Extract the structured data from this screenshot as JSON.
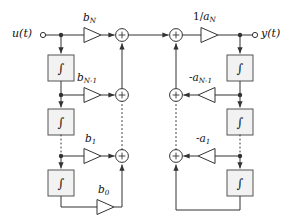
{
  "diagram": {
    "type": "signal-flow-block-diagram",
    "colors": {
      "line": "#333333",
      "block_fill": "#f2f2f2",
      "block_stroke": "#555555",
      "background": "#ffffff",
      "text": "#111111"
    },
    "terminals": {
      "input": {
        "label": "u(t)",
        "base": "u",
        "arg": "(t)"
      },
      "output": {
        "label": "y(t)",
        "base": "y",
        "arg": "(t)"
      }
    },
    "gains": {
      "feedforward": [
        {
          "id": "bN",
          "base": "b",
          "sub": "N",
          "label": "b_N",
          "row": 1,
          "direction": "right"
        },
        {
          "id": "bNm1",
          "base": "b",
          "sub": "N-1",
          "label": "b_N-1",
          "row": 2,
          "direction": "right"
        },
        {
          "id": "b1",
          "base": "b",
          "sub": "1",
          "label": "b_1",
          "row": 3,
          "direction": "right"
        },
        {
          "id": "b0",
          "base": "b",
          "sub": "0",
          "label": "b_0",
          "row": 4,
          "direction": "right"
        }
      ],
      "feedback": [
        {
          "id": "aNm1",
          "prefix": "-",
          "base": "a",
          "sub": "N-1",
          "label": "-a_N-1",
          "row": 2,
          "direction": "left"
        },
        {
          "id": "a1",
          "prefix": "-",
          "base": "a",
          "sub": "1",
          "label": "-a_1",
          "row": 3,
          "direction": "left"
        }
      ],
      "output_gain": {
        "id": "invaN",
        "prefix": "1/",
        "base": "a",
        "sub": "N",
        "label": "1/a_N",
        "row": 1,
        "direction": "right"
      }
    },
    "blocks": {
      "integrator_symbol": "∫",
      "integrator_name": "integrator",
      "left_count": 3,
      "right_count": 3
    },
    "summers": {
      "symbol": "+",
      "left_count": 3,
      "right_count": 3
    },
    "ellipsis_note": "dash-dot vertical segments indicate repeated stages"
  }
}
